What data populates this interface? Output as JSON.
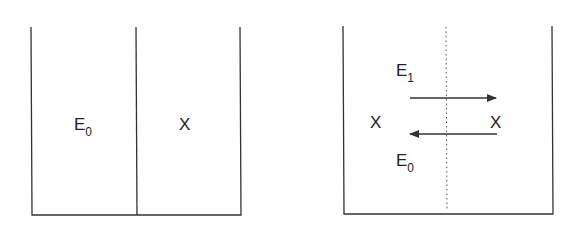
{
  "left_panel": {
    "left_label": {
      "main": "E",
      "sub": "0"
    },
    "right_label": "X",
    "divider": "solid"
  },
  "right_panel": {
    "top_label": {
      "main": "E",
      "sub": "1"
    },
    "bottom_label": {
      "main": "E",
      "sub": "0"
    },
    "left_species": "X",
    "right_species": "X",
    "divider": "dotted",
    "arrows": [
      {
        "direction": "right",
        "label": "E1"
      },
      {
        "direction": "left",
        "label": "E0"
      }
    ]
  },
  "colors": {
    "stroke": "#333333",
    "text": "#222222"
  }
}
